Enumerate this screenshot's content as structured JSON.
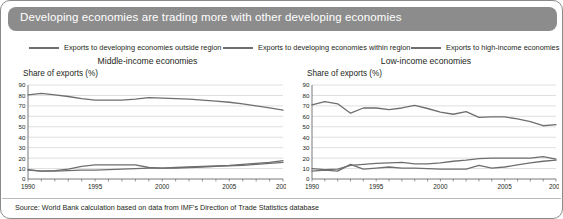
{
  "header": {
    "title": "Developing economies are trading more with other developing economies",
    "bar_color": "#8c8c8c",
    "text_color": "#ffffff"
  },
  "legend": {
    "items": [
      {
        "label": "Exports to developing economies outside region",
        "color": "#6e6e6e"
      },
      {
        "label": "Exports to developing economies within region",
        "color": "#6e6e6e"
      },
      {
        "label": "Exports to high-income economies",
        "color": "#6e6e6e"
      }
    ]
  },
  "source": {
    "text": "Source: World Bank calculation based on data from IMF's Direction of Trade Statistics database"
  },
  "chart_data": [
    {
      "type": "line",
      "title": "Middle-income economies",
      "xlabel": "",
      "ylabel": "Share of exports (%)",
      "x": [
        1990,
        1991,
        1992,
        1993,
        1994,
        1995,
        1996,
        1997,
        1998,
        1999,
        2000,
        2001,
        2002,
        2003,
        2004,
        2005,
        2006,
        2007,
        2008,
        2009
      ],
      "xlim": [
        1990,
        2009
      ],
      "xticks": [
        1990,
        1995,
        2000,
        2005,
        2009
      ],
      "ylim": [
        0,
        90
      ],
      "yticks": [
        0,
        10,
        20,
        30,
        40,
        50,
        60,
        70,
        80,
        90
      ],
      "grid": true,
      "legend_position": "top",
      "series": [
        {
          "name": "Exports to high-income economies",
          "values": [
            80.5,
            82.0,
            80.5,
            79.0,
            77.0,
            75.5,
            75.5,
            75.5,
            76.5,
            78.0,
            77.5,
            77.0,
            76.5,
            75.5,
            74.5,
            73.5,
            72.0,
            70.0,
            68.0,
            66.0
          ]
        },
        {
          "name": "Exports to developing economies within region",
          "values": [
            9.0,
            7.5,
            8.0,
            9.5,
            12.0,
            13.5,
            13.5,
            13.5,
            13.5,
            11.0,
            10.5,
            11.0,
            11.5,
            12.0,
            12.5,
            13.0,
            14.0,
            15.0,
            16.0,
            17.5
          ]
        },
        {
          "name": "Exports to developing economies outside region",
          "values": [
            8.5,
            7.5,
            7.5,
            8.0,
            8.5,
            8.5,
            9.0,
            9.5,
            10.0,
            10.5,
            10.5,
            10.5,
            11.0,
            11.5,
            12.0,
            12.5,
            13.0,
            14.0,
            15.0,
            16.0
          ]
        }
      ]
    },
    {
      "type": "line",
      "title": "Low-income economies",
      "xlabel": "",
      "ylabel": "Share of exports (%)",
      "x": [
        1990,
        1991,
        1992,
        1993,
        1994,
        1995,
        1996,
        1997,
        1998,
        1999,
        2000,
        2001,
        2002,
        2003,
        2004,
        2005,
        2006,
        2007,
        2008,
        2009
      ],
      "xlim": [
        1990,
        2009
      ],
      "xticks": [
        1990,
        1995,
        2000,
        2005,
        2009
      ],
      "ylim": [
        0,
        90
      ],
      "yticks": [
        0,
        10,
        20,
        30,
        40,
        50,
        60,
        70,
        80,
        90
      ],
      "grid": true,
      "legend_position": "top",
      "series": [
        {
          "name": "Exports to high-income economies",
          "values": [
            71.0,
            74.0,
            72.0,
            63.0,
            68.0,
            68.0,
            66.5,
            68.0,
            70.5,
            67.5,
            64.0,
            62.0,
            64.5,
            59.0,
            59.5,
            59.5,
            57.5,
            55.0,
            51.0,
            52.0
          ]
        },
        {
          "name": "Exports to developing economies within region",
          "values": [
            7.5,
            8.5,
            7.5,
            14.0,
            9.5,
            10.5,
            11.5,
            10.5,
            10.5,
            10.0,
            9.5,
            9.5,
            9.5,
            13.0,
            10.5,
            11.5,
            13.5,
            15.5,
            17.0,
            18.0
          ]
        },
        {
          "name": "Exports to developing economies outside region",
          "values": [
            10.0,
            9.0,
            9.5,
            13.0,
            14.0,
            15.0,
            15.5,
            16.0,
            14.5,
            14.5,
            15.5,
            17.0,
            18.0,
            19.5,
            20.0,
            20.0,
            20.0,
            20.0,
            21.5,
            19.0
          ]
        }
      ]
    }
  ]
}
